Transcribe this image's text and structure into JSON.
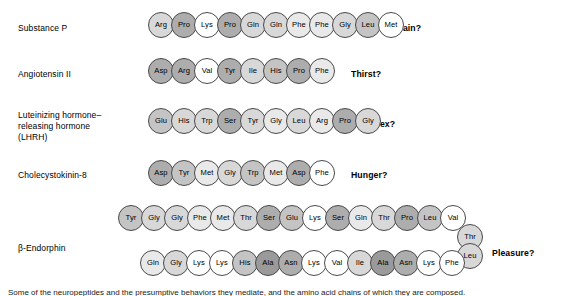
{
  "figure": {
    "bead_diameter_px": 26,
    "bead_overlap_px": 3,
    "shading_legend": {
      "sh0": "#ffffff",
      "sh1": "#e9e9e9",
      "sh2": "#d8d8d8",
      "sh3": "#c4c4c4",
      "sh4": "#adadad",
      "sh5": "#9a9a9a"
    }
  },
  "caption": {
    "text": "Some of the neuropeptides and the presumptive behaviors they mediate, and the amino acid chains of which they are composed."
  },
  "rows": [
    {
      "id": "substance-p",
      "label": "Substance P",
      "label_x": 18,
      "label_y": 23,
      "question": "Pain?",
      "question_x": 397,
      "question_y": 23,
      "chain_x": 148,
      "chain_y": 12,
      "residues": [
        {
          "name": "Arg",
          "shade": "sh2"
        },
        {
          "name": "Pro",
          "shade": "sh4"
        },
        {
          "name": "Lys",
          "shade": "sh0"
        },
        {
          "name": "Pro",
          "shade": "sh4"
        },
        {
          "name": "Gln",
          "shade": "sh2"
        },
        {
          "name": "Gln",
          "shade": "sh2"
        },
        {
          "name": "Phe",
          "shade": "sh1"
        },
        {
          "name": "Phe",
          "shade": "sh1"
        },
        {
          "name": "Gly",
          "shade": "sh2"
        },
        {
          "name": "Leu",
          "shade": "sh3"
        },
        {
          "name": "Met",
          "shade": "sh0"
        }
      ]
    },
    {
      "id": "angiotensin-ii",
      "label": "Angiotensin II",
      "label_x": 18,
      "label_y": 69,
      "question": "Thirst?",
      "question_x": 351,
      "question_y": 69,
      "chain_x": 148,
      "chain_y": 58,
      "residues": [
        {
          "name": "Asp",
          "shade": "sh4"
        },
        {
          "name": "Arg",
          "shade": "sh4"
        },
        {
          "name": "Val",
          "shade": "sh0"
        },
        {
          "name": "Tyr",
          "shade": "sh4"
        },
        {
          "name": "Ile",
          "shade": "sh2"
        },
        {
          "name": "His",
          "shade": "sh3"
        },
        {
          "name": "Pro",
          "shade": "sh4"
        },
        {
          "name": "Phe",
          "shade": "sh1"
        }
      ]
    },
    {
      "id": "lhrh",
      "label": "Luteinizing hormone–\nreleasing hormone\n(LHRH)",
      "label_x": 18,
      "label_y": 110,
      "question": "Sex?",
      "question_x": 374,
      "question_y": 119,
      "chain_x": 148,
      "chain_y": 108,
      "residues": [
        {
          "name": "Glu",
          "shade": "sh3"
        },
        {
          "name": "His",
          "shade": "sh2"
        },
        {
          "name": "Trp",
          "shade": "sh2"
        },
        {
          "name": "Ser",
          "shade": "sh4"
        },
        {
          "name": "Tyr",
          "shade": "sh2"
        },
        {
          "name": "Gly",
          "shade": "sh1"
        },
        {
          "name": "Leu",
          "shade": "sh2"
        },
        {
          "name": "Arg",
          "shade": "sh1"
        },
        {
          "name": "Pro",
          "shade": "sh4"
        },
        {
          "name": "Gly",
          "shade": "sh2"
        }
      ]
    },
    {
      "id": "cholecystokinin-8",
      "label": "Cholecystokinin-8",
      "label_x": 18,
      "label_y": 170,
      "question": "Hunger?",
      "question_x": 351,
      "question_y": 170,
      "chain_x": 148,
      "chain_y": 160,
      "residues": [
        {
          "name": "Asp",
          "shade": "sh4"
        },
        {
          "name": "Tyr",
          "shade": "sh3"
        },
        {
          "name": "Met",
          "shade": "sh1"
        },
        {
          "name": "Gly",
          "shade": "sh2"
        },
        {
          "name": "Trp",
          "shade": "sh3"
        },
        {
          "name": "Met",
          "shade": "sh1"
        },
        {
          "name": "Asp",
          "shade": "sh4"
        },
        {
          "name": "Phe",
          "shade": "sh0"
        }
      ]
    },
    {
      "id": "beta-endorphin",
      "label": "β-Endorphin",
      "label_x": 18,
      "label_y": 243,
      "question": "Pleasure?",
      "question_x": 492,
      "question_y": 248,
      "top_chain_x": 118,
      "top_chain_y": 205,
      "top_residues": [
        {
          "name": "Tyr",
          "shade": "sh3"
        },
        {
          "name": "Gly",
          "shade": "sh2"
        },
        {
          "name": "Gly",
          "shade": "sh2"
        },
        {
          "name": "Phe",
          "shade": "sh1"
        },
        {
          "name": "Met",
          "shade": "sh1"
        },
        {
          "name": "Thr",
          "shade": "sh2"
        },
        {
          "name": "Ser",
          "shade": "sh4"
        },
        {
          "name": "Glu",
          "shade": "sh3"
        },
        {
          "name": "Lys",
          "shade": "sh0"
        },
        {
          "name": "Ser",
          "shade": "sh4"
        },
        {
          "name": "Gln",
          "shade": "sh1"
        },
        {
          "name": "Thr",
          "shade": "sh2"
        },
        {
          "name": "Pro",
          "shade": "sh4"
        },
        {
          "name": "Leu",
          "shade": "sh3"
        },
        {
          "name": "Val",
          "shade": "sh0"
        }
      ],
      "turn_residues": [
        {
          "name": "Thr",
          "shade": "sh2",
          "x": 457,
          "y": 224
        },
        {
          "name": "Leu",
          "shade": "sh2",
          "x": 457,
          "y": 243
        }
      ],
      "bottom_chain_x": 140,
      "bottom_chain_y": 250,
      "bottom_residues": [
        {
          "name": "Gln",
          "shade": "sh1"
        },
        {
          "name": "Gly",
          "shade": "sh2"
        },
        {
          "name": "Lys",
          "shade": "sh0"
        },
        {
          "name": "Lys",
          "shade": "sh0"
        },
        {
          "name": "His",
          "shade": "sh3"
        },
        {
          "name": "Ala",
          "shade": "sh5"
        },
        {
          "name": "Asn",
          "shade": "sh4"
        },
        {
          "name": "Lys",
          "shade": "sh0"
        },
        {
          "name": "Val",
          "shade": "sh0"
        },
        {
          "name": "Ile",
          "shade": "sh2"
        },
        {
          "name": "Ala",
          "shade": "sh5"
        },
        {
          "name": "Asn",
          "shade": "sh4"
        },
        {
          "name": "Lys",
          "shade": "sh0"
        },
        {
          "name": "Phe",
          "shade": "sh0"
        }
      ]
    }
  ]
}
